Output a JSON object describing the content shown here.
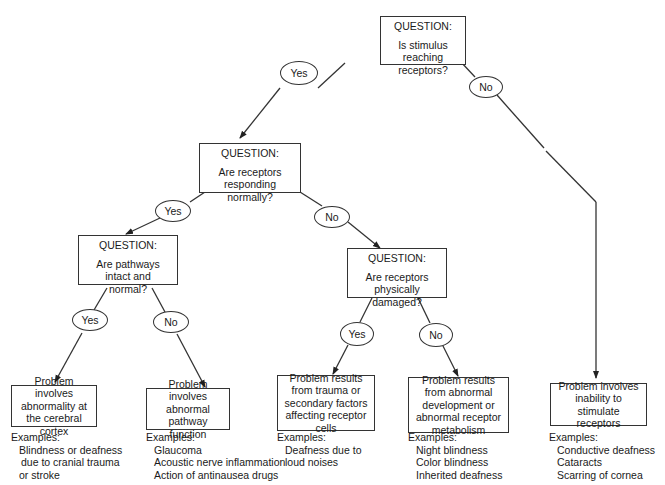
{
  "diagram": {
    "type": "decision-tree",
    "questions": [
      {
        "id": "q1",
        "label": "QUESTION:",
        "text": "Is stimulus reaching receptors?"
      },
      {
        "id": "q2",
        "label": "QUESTION:",
        "text": "Are receptors responding normally?"
      },
      {
        "id": "q3",
        "label": "QUESTION:",
        "text": "Are pathways intact and normal?"
      },
      {
        "id": "q4",
        "label": "QUESTION:",
        "text": "Are receptors physically damaged?"
      }
    ],
    "answers": {
      "q1_yes": "Yes",
      "q1_no": "No",
      "q2_yes": "Yes",
      "q2_no": "No",
      "q3_yes": "Yes",
      "q3_no": "No",
      "q4_yes": "Yes",
      "q4_no": "No"
    },
    "outcomes": [
      {
        "id": "o1",
        "text": "Problem involves abnormality at the cerebral cortex",
        "examples_label": "Examples:",
        "examples": [
          "Blindness or deafness",
          "due to cranial trauma",
          "or stroke"
        ]
      },
      {
        "id": "o2",
        "text": "Problem involves abnormal pathway function",
        "examples_label": "Examples:",
        "examples": [
          "Glaucoma",
          "Acoustic nerve inflammation",
          "Action of antinausea drugs"
        ]
      },
      {
        "id": "o3",
        "text": "Problem results from trauma or secondary factors affecting receptor cells",
        "examples_label": "Examples:",
        "examples": [
          "Deafness due to",
          "loud noises"
        ]
      },
      {
        "id": "o4",
        "text": "Problem results from abnormal development or abnormal receptor metabolism",
        "examples_label": "Examples:",
        "examples": [
          "Night blindness",
          "Color blindness",
          "Inherited deafness"
        ]
      },
      {
        "id": "o5",
        "text": "Problem involves inability to stimulate receptors",
        "examples_label": "Examples:",
        "examples": [
          "Conductive deafness",
          "Cataracts",
          "Scarring of cornea"
        ]
      }
    ],
    "edges": [
      {
        "from": "q1",
        "answer": "Yes",
        "to": "q2"
      },
      {
        "from": "q1",
        "answer": "No",
        "to": "o5"
      },
      {
        "from": "q2",
        "answer": "Yes",
        "to": "q3"
      },
      {
        "from": "q2",
        "answer": "No",
        "to": "q4"
      },
      {
        "from": "q3",
        "answer": "Yes",
        "to": "o1"
      },
      {
        "from": "q3",
        "answer": "No",
        "to": "o2"
      },
      {
        "from": "q4",
        "answer": "Yes",
        "to": "o3"
      },
      {
        "from": "q4",
        "answer": "No",
        "to": "o4"
      }
    ]
  }
}
